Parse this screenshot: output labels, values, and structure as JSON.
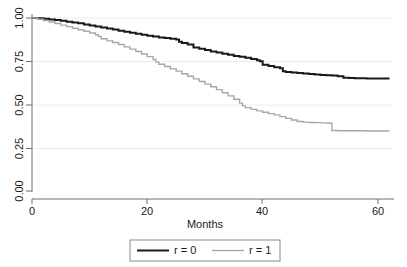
{
  "chart_data": {
    "type": "line",
    "title": "",
    "subtitle": "",
    "xlabel": "Months",
    "ylabel": "",
    "xlim": [
      0,
      62
    ],
    "ylim": [
      0.0,
      1.0
    ],
    "xticks": [
      0,
      20,
      40,
      60
    ],
    "xticklabels": [
      "0",
      "20",
      "40",
      "60"
    ],
    "yticks": [
      0.0,
      0.25,
      0.5,
      0.75,
      1.0
    ],
    "yticklabels": [
      "0.00",
      "0.25",
      "0.50",
      "0.75",
      "1.00"
    ],
    "grid": "horizontal",
    "grid_color": "#e8e8e8",
    "legend_position": "bottom-center",
    "series": [
      {
        "name": "r = 0",
        "color": "#1a1a1a",
        "width": 2.0,
        "points": [
          [
            0,
            1.0
          ],
          [
            1,
            0.998
          ],
          [
            2,
            0.995
          ],
          [
            3,
            0.992
          ],
          [
            4,
            0.988
          ],
          [
            5,
            0.984
          ],
          [
            6,
            0.979
          ],
          [
            7,
            0.974
          ],
          [
            8,
            0.969
          ],
          [
            9,
            0.963
          ],
          [
            10,
            0.957
          ],
          [
            11,
            0.951
          ],
          [
            12,
            0.945
          ],
          [
            13,
            0.939
          ],
          [
            14,
            0.933
          ],
          [
            15,
            0.927
          ],
          [
            16,
            0.921
          ],
          [
            17,
            0.915
          ],
          [
            18,
            0.909
          ],
          [
            19,
            0.903
          ],
          [
            20,
            0.898
          ],
          [
            21,
            0.893
          ],
          [
            22,
            0.888
          ],
          [
            23,
            0.884
          ],
          [
            24,
            0.88
          ],
          [
            25,
            0.876
          ],
          [
            25.5,
            0.862
          ],
          [
            26,
            0.856
          ],
          [
            27,
            0.847
          ],
          [
            28,
            0.83
          ],
          [
            29,
            0.822
          ],
          [
            30,
            0.815
          ],
          [
            31,
            0.807
          ],
          [
            32,
            0.8
          ],
          [
            33,
            0.793
          ],
          [
            34,
            0.787
          ],
          [
            35,
            0.781
          ],
          [
            36,
            0.776
          ],
          [
            37,
            0.77
          ],
          [
            38,
            0.763
          ],
          [
            39,
            0.756
          ],
          [
            39.5,
            0.75
          ],
          [
            40,
            0.73
          ],
          [
            41,
            0.723
          ],
          [
            42,
            0.716
          ],
          [
            43,
            0.71
          ],
          [
            43.5,
            0.692
          ],
          [
            44,
            0.688
          ],
          [
            45,
            0.685
          ],
          [
            46,
            0.682
          ],
          [
            47,
            0.679
          ],
          [
            48,
            0.676
          ],
          [
            49,
            0.673
          ],
          [
            50,
            0.671
          ],
          [
            51,
            0.669
          ],
          [
            52,
            0.667
          ],
          [
            53,
            0.664
          ],
          [
            54,
            0.655
          ],
          [
            55,
            0.653
          ],
          [
            56,
            0.652
          ],
          [
            58,
            0.651
          ],
          [
            60,
            0.65
          ],
          [
            62,
            0.65
          ]
        ]
      },
      {
        "name": "r = 1",
        "color": "#a8a8a8",
        "width": 1.4,
        "points": [
          [
            0,
            1.0
          ],
          [
            1,
            0.993
          ],
          [
            2,
            0.985
          ],
          [
            3,
            0.977
          ],
          [
            4,
            0.968
          ],
          [
            5,
            0.959
          ],
          [
            6,
            0.95
          ],
          [
            7,
            0.941
          ],
          [
            8,
            0.932
          ],
          [
            9,
            0.923
          ],
          [
            10,
            0.913
          ],
          [
            11,
            0.903
          ],
          [
            11.5,
            0.894
          ],
          [
            12,
            0.88
          ],
          [
            13,
            0.868
          ],
          [
            14,
            0.858
          ],
          [
            15,
            0.847
          ],
          [
            16,
            0.833
          ],
          [
            17,
            0.82
          ],
          [
            18,
            0.806
          ],
          [
            19,
            0.792
          ],
          [
            20,
            0.777
          ],
          [
            21,
            0.76
          ],
          [
            21.5,
            0.745
          ],
          [
            22,
            0.733
          ],
          [
            23,
            0.72
          ],
          [
            24,
            0.706
          ],
          [
            25,
            0.693
          ],
          [
            26,
            0.678
          ],
          [
            27,
            0.663
          ],
          [
            28,
            0.648
          ],
          [
            29,
            0.633
          ],
          [
            30,
            0.618
          ],
          [
            31,
            0.603
          ],
          [
            32,
            0.586
          ],
          [
            33,
            0.568
          ],
          [
            34,
            0.55
          ],
          [
            35,
            0.53
          ],
          [
            36,
            0.508
          ],
          [
            36.5,
            0.492
          ],
          [
            37,
            0.482
          ],
          [
            38,
            0.472
          ],
          [
            39,
            0.463
          ],
          [
            40,
            0.455
          ],
          [
            41,
            0.447
          ],
          [
            42,
            0.44
          ],
          [
            43,
            0.43
          ],
          [
            44,
            0.42
          ],
          [
            45,
            0.41
          ],
          [
            46,
            0.402
          ],
          [
            47,
            0.398
          ],
          [
            48,
            0.396
          ],
          [
            49,
            0.395
          ],
          [
            50,
            0.394
          ],
          [
            51,
            0.393
          ],
          [
            51.5,
            0.392
          ],
          [
            52,
            0.35
          ],
          [
            53,
            0.348
          ],
          [
            55,
            0.348
          ],
          [
            58,
            0.347
          ],
          [
            60,
            0.347
          ],
          [
            62,
            0.347
          ]
        ]
      }
    ]
  },
  "legend": {
    "entries": [
      {
        "label": "r = 0",
        "color": "#1a1a1a"
      },
      {
        "label": "r = 1",
        "color": "#a8a8a8"
      }
    ]
  },
  "axes": {
    "x_title": "Months",
    "x_tick_0": "0",
    "x_tick_1": "20",
    "x_tick_2": "40",
    "x_tick_3": "60",
    "y_tick_0": "0.00",
    "y_tick_1": "0.25",
    "y_tick_2": "0.50",
    "y_tick_3": "0.75",
    "y_tick_4": "1.00"
  }
}
